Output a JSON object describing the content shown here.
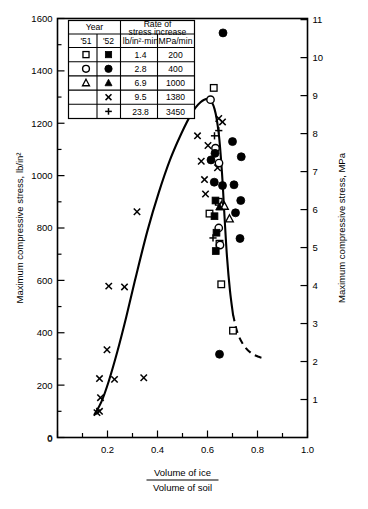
{
  "figure": {
    "title": "",
    "xaxis_label_numerator": "Volume of ice",
    "xaxis_label_denominator": "Volume of soil",
    "yaxis_left_label": "Maximum compressive stress, lb/in²",
    "yaxis_right_label": "Maximum compressive stress, MPa"
  },
  "legend": {
    "header_year": "Year",
    "header_rate_line1": "Rate of",
    "header_rate_line2": "stress increase",
    "col_year_1951": "'51",
    "col_year_1952": "'52",
    "col_unit_imperial": "lb/in²·min",
    "col_unit_metric": "MPa/min",
    "rows": [
      {
        "sym51": "open-square",
        "sym52": "filled-square",
        "imperial": "1.4",
        "metric": "200"
      },
      {
        "sym51": "open-circle",
        "sym52": "filled-circle",
        "imperial": "2.8",
        "metric": "400"
      },
      {
        "sym51": "open-triangle",
        "sym52": "filled-triangle",
        "imperial": "6.9",
        "metric": "1000"
      },
      {
        "sym51": "",
        "sym52": "cross",
        "imperial": "9.5",
        "metric": "1380"
      },
      {
        "sym51": "",
        "sym52": "plus",
        "imperial": "23.8",
        "metric": "3450"
      }
    ]
  },
  "chart_data": {
    "type": "scatter",
    "title": "",
    "xlabel": "Volume of ice / Volume of soil",
    "ylabel": "Maximum compressive stress, lb/in²",
    "ylabel_secondary": "Maximum compressive stress, MPa",
    "xlim": [
      0,
      1.0
    ],
    "ylim": [
      0,
      1600
    ],
    "ylim_secondary": [
      0,
      11.03
    ],
    "grid": false,
    "legend_position": "upper-left-inset",
    "xticks": [
      0,
      0.2,
      0.4,
      0.6,
      0.8,
      1.0
    ],
    "xtick_labels": [
      "0",
      "0.2",
      "0.4",
      "0.6",
      "0.8",
      "1.0"
    ],
    "yticks": [
      0,
      200,
      400,
      600,
      800,
      1000,
      1200,
      1400,
      1600
    ],
    "ytick_labels": [
      "0",
      "200",
      "400",
      "600",
      "800",
      "1000",
      "1200",
      "1400",
      "1600"
    ],
    "yticks_secondary": [
      1,
      2,
      3,
      4,
      5,
      6,
      7,
      8,
      9,
      10,
      11
    ],
    "ytick_labels_secondary": [
      "1",
      "2",
      "3",
      "4",
      "5",
      "6",
      "7",
      "8",
      "9",
      "10",
      "11"
    ],
    "series": [
      {
        "name": "open-square",
        "marker": "open-square",
        "points": [
          [
            0.625,
            1335
          ],
          [
            0.608,
            855
          ],
          [
            0.645,
            900
          ],
          [
            0.648,
            740
          ],
          [
            0.655,
            585
          ],
          [
            0.702,
            408
          ]
        ]
      },
      {
        "name": "filled-square",
        "marker": "filled-square",
        "points": [
          [
            0.632,
            905
          ],
          [
            0.628,
            845
          ],
          [
            0.636,
            782
          ],
          [
            0.633,
            712
          ]
        ]
      },
      {
        "name": "open-circle",
        "marker": "open-circle",
        "points": [
          [
            0.612,
            1290
          ],
          [
            0.632,
            1105
          ],
          [
            0.646,
            1048
          ],
          [
            0.645,
            800
          ],
          [
            0.65,
            735
          ]
        ]
      },
      {
        "name": "filled-circle",
        "marker": "filled-circle",
        "points": [
          [
            0.662,
            1545
          ],
          [
            0.63,
            1085
          ],
          [
            0.614,
            1060
          ],
          [
            0.627,
            975
          ],
          [
            0.7,
            1130
          ],
          [
            0.706,
            965
          ],
          [
            0.712,
            858
          ],
          [
            0.735,
            1072
          ],
          [
            0.733,
            905
          ],
          [
            0.73,
            760
          ],
          [
            0.66,
            962
          ],
          [
            0.648,
            318
          ]
        ]
      },
      {
        "name": "open-triangle",
        "marker": "open-triangle",
        "points": [
          [
            0.655,
            885
          ],
          [
            0.668,
            883
          ],
          [
            0.688,
            835
          ]
        ]
      },
      {
        "name": "filled-triangle",
        "marker": "filled-triangle",
        "points": [
          [
            0.648,
            880
          ]
        ]
      },
      {
        "name": "cross",
        "marker": "cross",
        "points": [
          [
            0.158,
            95
          ],
          [
            0.168,
            100
          ],
          [
            0.172,
            152
          ],
          [
            0.168,
            225
          ],
          [
            0.228,
            222
          ],
          [
            0.345,
            228
          ],
          [
            0.198,
            335
          ],
          [
            0.205,
            578
          ],
          [
            0.268,
            575
          ],
          [
            0.318,
            862
          ],
          [
            0.56,
            1152
          ],
          [
            0.575,
            1055
          ],
          [
            0.588,
            985
          ],
          [
            0.592,
            930
          ],
          [
            0.645,
            1218
          ],
          [
            0.66,
            1205
          ],
          [
            0.64,
            1030
          ],
          [
            0.602,
            1115
          ]
        ]
      },
      {
        "name": "plus",
        "marker": "plus",
        "points": [
          [
            0.628,
            1152
          ],
          [
            0.645,
            1172
          ],
          [
            0.622,
            762
          ]
        ]
      }
    ],
    "fit_curve": {
      "style_solid": "solid",
      "style_tail": "dashed",
      "description": "Peak near x=0.61, y≈1290; rises from x≈0.15, falls steeply past peak, dashed beyond x≈0.72",
      "solid_points": [
        [
          0.148,
          88
        ],
        [
          0.175,
          135
        ],
        [
          0.205,
          215
        ],
        [
          0.24,
          330
        ],
        [
          0.275,
          460
        ],
        [
          0.315,
          620
        ],
        [
          0.36,
          790
        ],
        [
          0.405,
          935
        ],
        [
          0.45,
          1060
        ],
        [
          0.495,
          1160
        ],
        [
          0.535,
          1235
        ],
        [
          0.572,
          1280
        ],
        [
          0.605,
          1292
        ],
        [
          0.628,
          1255
        ],
        [
          0.645,
          1160
        ],
        [
          0.658,
          1010
        ],
        [
          0.668,
          845
        ],
        [
          0.678,
          690
        ],
        [
          0.69,
          560
        ],
        [
          0.702,
          470
        ]
      ],
      "dashed_points": [
        [
          0.702,
          470
        ],
        [
          0.72,
          400
        ],
        [
          0.745,
          352
        ],
        [
          0.775,
          322
        ],
        [
          0.805,
          308
        ],
        [
          0.83,
          302
        ]
      ]
    }
  }
}
